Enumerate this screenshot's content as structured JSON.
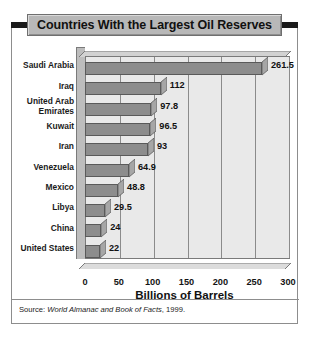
{
  "title": "Countries With the Largest Oil Reserves",
  "source": {
    "prefix": "Source: ",
    "italic": "World Almanac and Book of Facts",
    "suffix": ", 1999."
  },
  "colors": {
    "title_band": "#b8b8b8",
    "title_cap": "#1a1a1a",
    "plot_background": "#e9e9e9",
    "bar_front": "#8d8d8d",
    "bar_top": "#c9c9c9",
    "gridline": "#8b8b8b",
    "frame": "#8d8d8d",
    "text": "#111111"
  },
  "chart_data": {
    "type": "bar",
    "orientation": "horizontal",
    "title": "Countries With the Largest Oil Reserves",
    "xlabel": "Billions of Barrels",
    "ylabel": "",
    "xlim": [
      0,
      300
    ],
    "xticks": [
      0,
      50,
      100,
      150,
      200,
      250,
      300
    ],
    "xtick_labels": [
      "0",
      "50",
      "100",
      "150",
      "200",
      "250",
      "300"
    ],
    "grid": true,
    "legend": false,
    "categories": [
      "Saudi Arabia",
      "Iraq",
      "United Arab Emirates",
      "Kuwait",
      "Iran",
      "Venezuela",
      "Mexico",
      "Libya",
      "China",
      "United States"
    ],
    "values": [
      261.5,
      112,
      97.8,
      96.5,
      93,
      64.9,
      48.8,
      29.5,
      24,
      22
    ],
    "value_labels": [
      "261.5",
      "112",
      "97.8",
      "96.5",
      "93",
      "64.9",
      "48.8",
      "29.5",
      "24",
      "22"
    ],
    "category_lines": [
      [
        "Saudi Arabia"
      ],
      [
        "Iraq"
      ],
      [
        "United Arab",
        "Emirates"
      ],
      [
        "Kuwait"
      ],
      [
        "Iran"
      ],
      [
        "Venezuela"
      ],
      [
        "Mexico"
      ],
      [
        "Libya"
      ],
      [
        "China"
      ],
      [
        "United States"
      ]
    ]
  }
}
